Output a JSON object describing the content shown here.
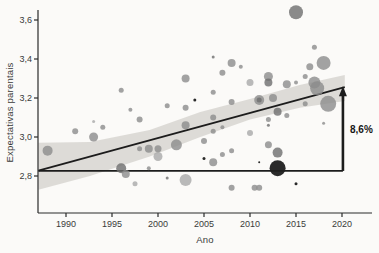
{
  "chart_data": {
    "type": "scatter",
    "title": "",
    "xlabel": "Ano",
    "ylabel": "Expectativas parentais",
    "xlim": [
      1987,
      2022.5
    ],
    "ylim": [
      2.61,
      3.65
    ],
    "grid": false,
    "legend": "none",
    "x_ticks": [
      {
        "value": 1990,
        "label": "1990"
      },
      {
        "value": 1995,
        "label": "1995"
      },
      {
        "value": 2000,
        "label": "2000"
      },
      {
        "value": 2005,
        "label": "2005"
      },
      {
        "value": 2010,
        "label": "2010"
      },
      {
        "value": 2015,
        "label": "2015"
      },
      {
        "value": 2020,
        "label": "2020"
      }
    ],
    "y_ticks": [
      {
        "value": 2.8,
        "label": "2,8"
      },
      {
        "value": 3.0,
        "label": "3,0"
      },
      {
        "value": 3.2,
        "label": "3,2"
      },
      {
        "value": 3.4,
        "label": "3,4"
      },
      {
        "value": 3.6,
        "label": "3,6"
      }
    ],
    "trend_line": {
      "x1": 1987,
      "y1": 2.828,
      "x2": 2020.3,
      "y2": 3.256
    },
    "reference_line": {
      "value": 2.826,
      "x1": 1987,
      "x2": 2020.1
    },
    "annotation": {
      "label": "8,6%",
      "x": 2020.1,
      "from": 2.826,
      "to": 3.25
    },
    "confidence_band": {
      "note": "pairs of [year, upper, lower]",
      "points": [
        [
          1987,
          2.97,
          2.73
        ],
        [
          1992.6,
          2.974,
          2.8
        ],
        [
          1999.1,
          3.036,
          2.9
        ],
        [
          2004.6,
          3.128,
          3.0
        ],
        [
          2010,
          3.195,
          3.09
        ],
        [
          2015.4,
          3.267,
          3.15
        ],
        [
          2020.3,
          3.318,
          3.185
        ]
      ]
    },
    "point_format": [
      "year",
      "value",
      "radius_px",
      "shade"
    ],
    "points": [
      [
        1988,
        2.93,
        5,
        "mid"
      ],
      [
        1991,
        3.03,
        3,
        "mid"
      ],
      [
        1993,
        3.0,
        4.5,
        "mid"
      ],
      [
        1993,
        3.08,
        1.5,
        "light"
      ],
      [
        1994,
        3.05,
        2.5,
        "mid"
      ],
      [
        1996,
        3.24,
        2.5,
        "mid"
      ],
      [
        1997,
        3.14,
        2,
        "mid"
      ],
      [
        1998,
        3.09,
        3,
        "mid"
      ],
      [
        1998,
        2.94,
        2.5,
        "mid"
      ],
      [
        1996,
        2.84,
        5,
        "dark"
      ],
      [
        1996.5,
        2.81,
        4,
        "mid"
      ],
      [
        1997.5,
        2.76,
        2.5,
        "light"
      ],
      [
        1999,
        2.94,
        4,
        "mid"
      ],
      [
        2000,
        2.9,
        4.5,
        "light"
      ],
      [
        2000,
        2.94,
        3.5,
        "mid"
      ],
      [
        1999,
        2.84,
        2,
        "mid"
      ],
      [
        2001,
        3.16,
        2.5,
        "mid"
      ],
      [
        2003,
        3.15,
        3,
        "mid"
      ],
      [
        2003,
        3.3,
        4,
        "mid"
      ],
      [
        2004,
        3.19,
        1.5,
        "black"
      ],
      [
        2006,
        3.41,
        1.5,
        "dark"
      ],
      [
        2008,
        3.38,
        4,
        "mid"
      ],
      [
        2009,
        3.36,
        2,
        "mid"
      ],
      [
        2007,
        3.33,
        3,
        "mid"
      ],
      [
        2010,
        3.28,
        3.5,
        "light"
      ],
      [
        2006,
        3.23,
        2.5,
        "mid"
      ],
      [
        2008,
        3.18,
        3,
        "mid"
      ],
      [
        2011,
        3.19,
        5,
        "mid"
      ],
      [
        2011,
        3.19,
        2.5,
        "dark"
      ],
      [
        2012.5,
        3.2,
        4,
        "mid"
      ],
      [
        2013,
        3.13,
        4,
        "dark"
      ],
      [
        2012,
        3.09,
        2.5,
        "mid"
      ],
      [
        2014,
        3.11,
        2.5,
        "mid"
      ],
      [
        2015,
        3.64,
        7,
        "dark"
      ],
      [
        2017,
        3.46,
        2.5,
        "mid"
      ],
      [
        2018,
        3.38,
        7,
        "mid"
      ],
      [
        2016.5,
        3.36,
        3.5,
        "mid"
      ],
      [
        2012,
        3.31,
        4.5,
        "mid"
      ],
      [
        2012,
        3.28,
        4,
        "dark"
      ],
      [
        2014,
        3.27,
        4,
        "mid"
      ],
      [
        2015,
        3.28,
        2,
        "mid"
      ],
      [
        2016,
        3.31,
        2.5,
        "mid"
      ],
      [
        2017,
        3.28,
        6,
        "mid"
      ],
      [
        2017.3,
        3.25,
        7,
        "mid"
      ],
      [
        2018.5,
        3.17,
        8,
        "mid"
      ],
      [
        2016,
        3.17,
        2.5,
        "mid"
      ],
      [
        2003,
        3.06,
        4,
        "mid"
      ],
      [
        2006,
        3.1,
        3,
        "mid"
      ],
      [
        2006,
        3.03,
        2.5,
        "mid"
      ],
      [
        2007,
        3.05,
        2,
        "mid"
      ],
      [
        2010,
        3.02,
        3,
        "light"
      ],
      [
        2002,
        2.96,
        5.5,
        "mid"
      ],
      [
        2005,
        2.98,
        3,
        "mid"
      ],
      [
        2007,
        2.91,
        2.5,
        "mid"
      ],
      [
        2008,
        2.93,
        2.5,
        "mid"
      ],
      [
        2005,
        2.89,
        1.5,
        "black"
      ],
      [
        2006,
        2.87,
        4,
        "mid"
      ],
      [
        2001,
        2.79,
        1.5,
        "dark"
      ],
      [
        2003,
        2.78,
        6,
        "light"
      ],
      [
        2008,
        2.74,
        3,
        "mid"
      ],
      [
        2010.5,
        2.74,
        3,
        "mid"
      ],
      [
        2012,
        3.06,
        1.5,
        "dark"
      ],
      [
        2018,
        3.07,
        1.5,
        "mid"
      ],
      [
        2012,
        2.96,
        3.5,
        "mid"
      ],
      [
        2013,
        2.92,
        5,
        "dark"
      ],
      [
        2011,
        2.87,
        1,
        "black"
      ],
      [
        2013,
        2.84,
        8,
        "black"
      ],
      [
        2011,
        2.74,
        3,
        "mid"
      ],
      [
        2015,
        2.76,
        1.5,
        "black"
      ]
    ],
    "colors": {
      "light": "#a9a9a9",
      "mid": "#8c8c8c",
      "dark": "#6e6e6e",
      "black": "#1f1f1f",
      "band": "#dad8d4",
      "line": "#1c1c1c",
      "axis": "#2b2b2b",
      "text": "#3a3a3a",
      "background": "#fbfaf8"
    }
  }
}
